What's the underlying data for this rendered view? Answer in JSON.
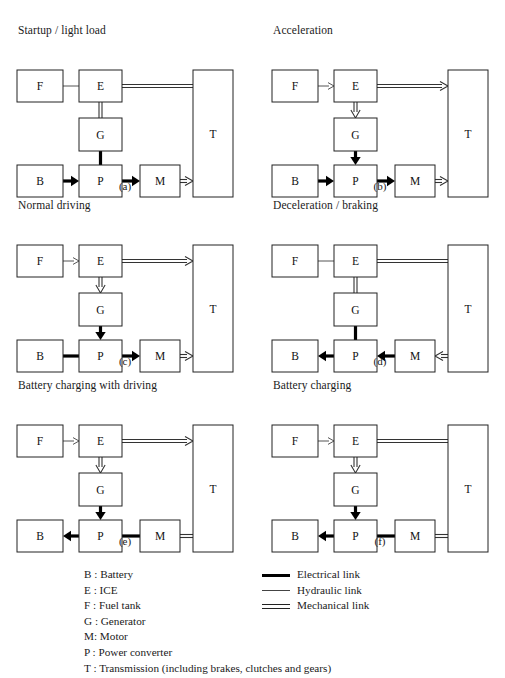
{
  "figure": {
    "panels": [
      {
        "id": "a",
        "title": "Startup / light load",
        "caption": "(a)",
        "boxes": {
          "F": "F",
          "E": "E",
          "G": "G",
          "B": "B",
          "P": "P",
          "M": "M",
          "T": "T"
        },
        "links": [
          {
            "from": "F",
            "to": "E",
            "type": "hydraulic",
            "arrow": "none",
            "dir": "right"
          },
          {
            "from": "E",
            "to": "T",
            "type": "mechanical",
            "arrow": "none",
            "dir": "right"
          },
          {
            "from": "E",
            "to": "G",
            "type": "mechanical",
            "arrow": "none",
            "dir": "down"
          },
          {
            "from": "G",
            "to": "P",
            "type": "electrical",
            "arrow": "none",
            "dir": "down"
          },
          {
            "from": "B",
            "to": "P",
            "type": "electrical",
            "arrow": "solid",
            "dir": "right"
          },
          {
            "from": "P",
            "to": "M",
            "type": "electrical",
            "arrow": "solid",
            "dir": "right"
          },
          {
            "from": "M",
            "to": "T",
            "type": "mechanical",
            "arrow": "open",
            "dir": "right"
          }
        ]
      },
      {
        "id": "b",
        "title": "Acceleration",
        "caption": "(b)",
        "boxes": {
          "F": "F",
          "E": "E",
          "G": "G",
          "B": "B",
          "P": "P",
          "M": "M",
          "T": "T"
        },
        "links": [
          {
            "from": "F",
            "to": "E",
            "type": "hydraulic",
            "arrow": "open",
            "dir": "right"
          },
          {
            "from": "E",
            "to": "T",
            "type": "mechanical",
            "arrow": "open",
            "dir": "right"
          },
          {
            "from": "E",
            "to": "G",
            "type": "mechanical",
            "arrow": "open",
            "dir": "down"
          },
          {
            "from": "G",
            "to": "P",
            "type": "electrical",
            "arrow": "solid",
            "dir": "down"
          },
          {
            "from": "B",
            "to": "P",
            "type": "electrical",
            "arrow": "solid",
            "dir": "right"
          },
          {
            "from": "P",
            "to": "M",
            "type": "electrical",
            "arrow": "solid",
            "dir": "right"
          },
          {
            "from": "M",
            "to": "T",
            "type": "mechanical",
            "arrow": "open",
            "dir": "right"
          }
        ]
      },
      {
        "id": "c",
        "title": "Normal driving",
        "caption": "(c)",
        "boxes": {
          "F": "F",
          "E": "E",
          "G": "G",
          "B": "B",
          "P": "P",
          "M": "M",
          "T": "T"
        },
        "links": [
          {
            "from": "F",
            "to": "E",
            "type": "hydraulic",
            "arrow": "open",
            "dir": "right"
          },
          {
            "from": "E",
            "to": "T",
            "type": "mechanical",
            "arrow": "open",
            "dir": "right"
          },
          {
            "from": "E",
            "to": "G",
            "type": "mechanical",
            "arrow": "open",
            "dir": "down"
          },
          {
            "from": "G",
            "to": "P",
            "type": "electrical",
            "arrow": "solid",
            "dir": "down"
          },
          {
            "from": "B",
            "to": "P",
            "type": "electrical",
            "arrow": "none",
            "dir": "right"
          },
          {
            "from": "P",
            "to": "M",
            "type": "electrical",
            "arrow": "solid",
            "dir": "right"
          },
          {
            "from": "M",
            "to": "T",
            "type": "mechanical",
            "arrow": "open",
            "dir": "right"
          }
        ]
      },
      {
        "id": "d",
        "title": "Deceleration / braking",
        "caption": "(d)",
        "boxes": {
          "F": "F",
          "E": "E",
          "G": "G",
          "B": "B",
          "P": "P",
          "M": "M",
          "T": "T"
        },
        "links": [
          {
            "from": "F",
            "to": "E",
            "type": "hydraulic",
            "arrow": "none",
            "dir": "right"
          },
          {
            "from": "E",
            "to": "T",
            "type": "mechanical",
            "arrow": "none",
            "dir": "right"
          },
          {
            "from": "E",
            "to": "G",
            "type": "mechanical",
            "arrow": "none",
            "dir": "down"
          },
          {
            "from": "G",
            "to": "P",
            "type": "electrical",
            "arrow": "none",
            "dir": "down"
          },
          {
            "from": "P",
            "to": "B",
            "type": "electrical",
            "arrow": "solid",
            "dir": "left"
          },
          {
            "from": "M",
            "to": "P",
            "type": "electrical",
            "arrow": "solid",
            "dir": "left"
          },
          {
            "from": "T",
            "to": "M",
            "type": "mechanical",
            "arrow": "open",
            "dir": "left"
          }
        ]
      },
      {
        "id": "e",
        "title": "Battery charging with driving",
        "caption": "(e)",
        "boxes": {
          "F": "F",
          "E": "E",
          "G": "G",
          "B": "B",
          "P": "P",
          "M": "M",
          "T": "T"
        },
        "links": [
          {
            "from": "F",
            "to": "E",
            "type": "hydraulic",
            "arrow": "open",
            "dir": "right"
          },
          {
            "from": "E",
            "to": "T",
            "type": "mechanical",
            "arrow": "open",
            "dir": "right"
          },
          {
            "from": "E",
            "to": "G",
            "type": "mechanical",
            "arrow": "open",
            "dir": "down"
          },
          {
            "from": "G",
            "to": "P",
            "type": "electrical",
            "arrow": "solid",
            "dir": "down"
          },
          {
            "from": "P",
            "to": "B",
            "type": "electrical",
            "arrow": "solid",
            "dir": "left"
          },
          {
            "from": "M",
            "to": "P",
            "type": "electrical",
            "arrow": "none",
            "dir": "left"
          },
          {
            "from": "M",
            "to": "T",
            "type": "mechanical",
            "arrow": "none",
            "dir": "right"
          }
        ]
      },
      {
        "id": "f",
        "title": "Battery charging",
        "caption": "(f)",
        "boxes": {
          "F": "F",
          "E": "E",
          "G": "G",
          "B": "B",
          "P": "P",
          "M": "M",
          "T": "T"
        },
        "links": [
          {
            "from": "F",
            "to": "E",
            "type": "hydraulic",
            "arrow": "open",
            "dir": "right"
          },
          {
            "from": "E",
            "to": "T",
            "type": "mechanical",
            "arrow": "none",
            "dir": "right"
          },
          {
            "from": "E",
            "to": "G",
            "type": "mechanical",
            "arrow": "open",
            "dir": "down"
          },
          {
            "from": "G",
            "to": "P",
            "type": "electrical",
            "arrow": "solid",
            "dir": "down"
          },
          {
            "from": "P",
            "to": "B",
            "type": "electrical",
            "arrow": "solid",
            "dir": "left"
          },
          {
            "from": "M",
            "to": "P",
            "type": "electrical",
            "arrow": "none",
            "dir": "left"
          },
          {
            "from": "M",
            "to": "T",
            "type": "mechanical",
            "arrow": "none",
            "dir": "right"
          }
        ]
      }
    ]
  },
  "legend": {
    "abbreviations": [
      "B : Battery",
      "E : ICE",
      "F : Fuel tank",
      "G : Generator",
      "M: Motor",
      "P : Power converter",
      "T : Transmission (including brakes, clutches and gears)"
    ],
    "link_types": [
      {
        "sample": "electrical-link-sample",
        "label": "Electrical link"
      },
      {
        "sample": "hydraulic-link-sample",
        "label": "Hydraulic link"
      },
      {
        "sample": "mechanical-link-sample",
        "label": "Mechanical link"
      }
    ]
  },
  "colors": {
    "stroke": "#222222",
    "electrical": "#000000",
    "hydraulic": "#555555",
    "mechanical": "#333333",
    "background": "#ffffff"
  }
}
